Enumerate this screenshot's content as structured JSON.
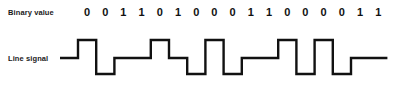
{
  "figure": {
    "title": "",
    "background_color": "#ffffff",
    "line_color": "#111111",
    "text_color": "#1a1a1a"
  },
  "labels": {
    "binary_value": "Binary value",
    "line_signal": "Line signal"
  },
  "chart_data": {
    "type": "line",
    "title": "",
    "subtitle": "",
    "xlabel": "",
    "ylabel": "",
    "encoding": "pseudoternary",
    "categories": [
      "0",
      "0",
      "1",
      "1",
      "0",
      "1",
      "0",
      "0",
      "0",
      "1",
      "1",
      "0",
      "0",
      "0",
      "0",
      "1",
      "1"
    ],
    "bits": [
      0,
      0,
      1,
      1,
      0,
      1,
      0,
      0,
      0,
      1,
      1,
      0,
      0,
      0,
      0,
      1,
      1
    ],
    "levels": [
      "high",
      "low",
      "mid",
      "mid",
      "high",
      "mid",
      "low",
      "high",
      "low",
      "mid",
      "mid",
      "high",
      "low",
      "high",
      "low",
      "mid",
      "mid"
    ],
    "values": [
      1,
      -1,
      0,
      0,
      1,
      0,
      -1,
      1,
      -1,
      0,
      0,
      1,
      -1,
      1,
      -1,
      0,
      0
    ],
    "ylim": [
      -1,
      1
    ],
    "ytick_labels": [
      "-",
      "0",
      "+"
    ],
    "grid": false,
    "legend": "none",
    "bit_count": 17,
    "geometry": {
      "x_start": 60,
      "x_end": 385,
      "bit_width": 18.2,
      "first_bit_center_x": 87,
      "y_high": 40,
      "y_mid": 58,
      "y_low": 74,
      "lead_in_x": 60,
      "lead_in_end_x": 78,
      "stroke_width": 2.4
    }
  }
}
